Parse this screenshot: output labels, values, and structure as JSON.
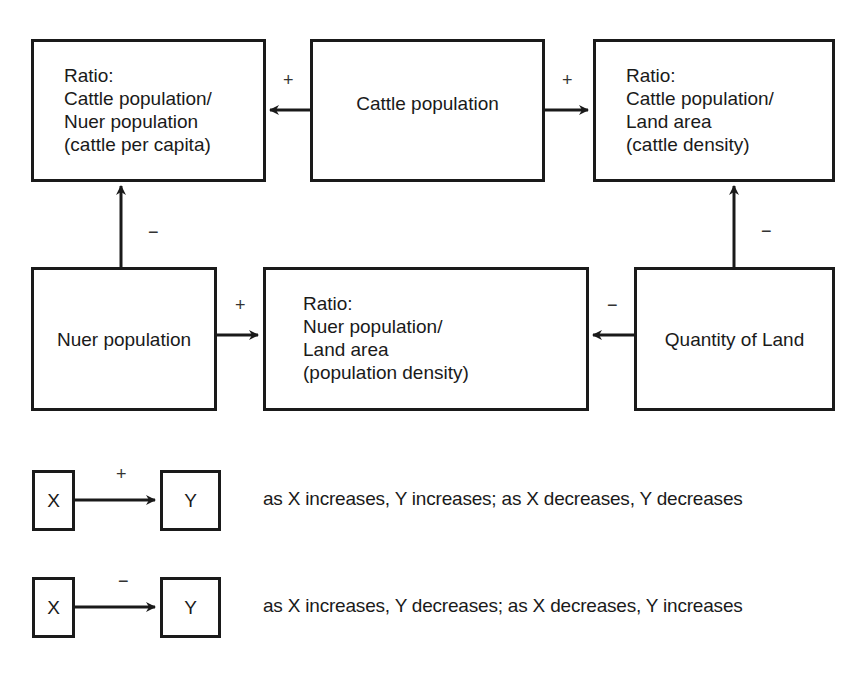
{
  "diagram": {
    "nodes": {
      "cattle_per_capita": {
        "label": "Ratio:\nCattle population/\nNuer population\n(cattle per capita)"
      },
      "cattle_population": {
        "label": "Cattle population"
      },
      "cattle_density": {
        "label": "Ratio:\nCattle population/\nLand area\n(cattle density)"
      },
      "nuer_population": {
        "label": "Nuer population"
      },
      "population_density": {
        "label": "Ratio:\nNuer population/\nLand area\n(population density)"
      },
      "quantity_of_land": {
        "label": "Quantity of Land"
      }
    },
    "edges": [
      {
        "from": "cattle_population",
        "to": "cattle_per_capita",
        "sign": "+"
      },
      {
        "from": "cattle_population",
        "to": "cattle_density",
        "sign": "+"
      },
      {
        "from": "nuer_population",
        "to": "cattle_per_capita",
        "sign": "−"
      },
      {
        "from": "nuer_population",
        "to": "population_density",
        "sign": "+"
      },
      {
        "from": "quantity_of_land",
        "to": "population_density",
        "sign": "−"
      },
      {
        "from": "quantity_of_land",
        "to": "cattle_density",
        "sign": "−"
      }
    ]
  },
  "legend": {
    "positive": {
      "x_label": "X",
      "y_label": "Y",
      "sign": "+",
      "description": "as X increases, Y increases; as X decreases, Y decreases"
    },
    "negative": {
      "x_label": "X",
      "y_label": "Y",
      "sign": "−",
      "description": "as X increases, Y decreases; as X decreases, Y increases"
    }
  }
}
